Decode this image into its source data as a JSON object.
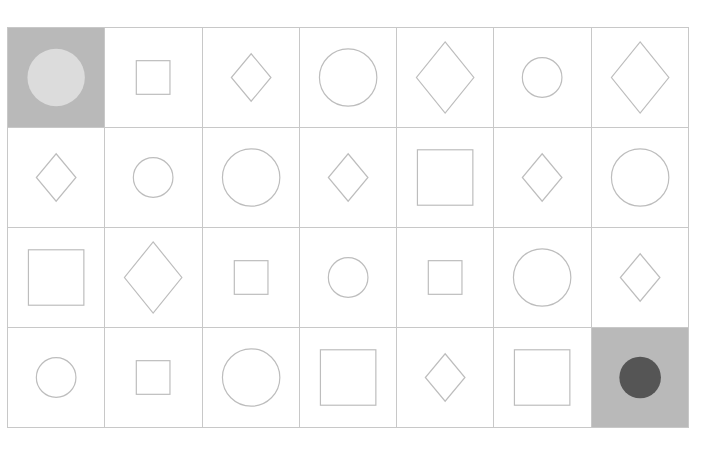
{
  "board": {
    "rows": 4,
    "cols": 7,
    "colors": {
      "grid_line": "#c8c8c8",
      "shape_stroke": "#bdbdbd",
      "highlight_bg": "#b9b9b9",
      "start_token": "#dcdcdc",
      "goal_token": "#555555"
    },
    "cells": [
      [
        {
          "shape": "token",
          "size": "large",
          "state": "start"
        },
        {
          "shape": "square",
          "size": "small"
        },
        {
          "shape": "diamond",
          "size": "small"
        },
        {
          "shape": "circle",
          "size": "large"
        },
        {
          "shape": "diamond",
          "size": "large"
        },
        {
          "shape": "circle",
          "size": "small"
        },
        {
          "shape": "diamond",
          "size": "large"
        }
      ],
      [
        {
          "shape": "diamond",
          "size": "small"
        },
        {
          "shape": "circle",
          "size": "small"
        },
        {
          "shape": "circle",
          "size": "large"
        },
        {
          "shape": "diamond",
          "size": "small"
        },
        {
          "shape": "square",
          "size": "large"
        },
        {
          "shape": "diamond",
          "size": "small"
        },
        {
          "shape": "circle",
          "size": "large"
        }
      ],
      [
        {
          "shape": "square",
          "size": "large"
        },
        {
          "shape": "diamond",
          "size": "large"
        },
        {
          "shape": "square",
          "size": "small"
        },
        {
          "shape": "circle",
          "size": "small"
        },
        {
          "shape": "square",
          "size": "small"
        },
        {
          "shape": "circle",
          "size": "large"
        },
        {
          "shape": "diamond",
          "size": "small"
        }
      ],
      [
        {
          "shape": "circle",
          "size": "small"
        },
        {
          "shape": "square",
          "size": "small"
        },
        {
          "shape": "circle",
          "size": "large"
        },
        {
          "shape": "square",
          "size": "large"
        },
        {
          "shape": "diamond",
          "size": "small"
        },
        {
          "shape": "square",
          "size": "large"
        },
        {
          "shape": "token",
          "size": "small",
          "state": "goal"
        }
      ]
    ]
  }
}
